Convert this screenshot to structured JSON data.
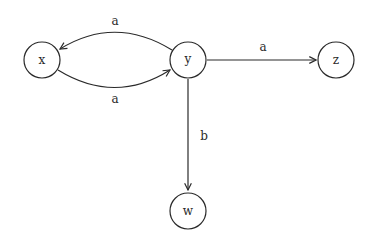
{
  "diagram": {
    "type": "state-graph",
    "nodes": [
      {
        "id": "x",
        "label": "x"
      },
      {
        "id": "y",
        "label": "y"
      },
      {
        "id": "z",
        "label": "z"
      },
      {
        "id": "w",
        "label": "w"
      }
    ],
    "edges": [
      {
        "from": "y",
        "to": "x",
        "label": "a"
      },
      {
        "from": "x",
        "to": "y",
        "label": "a"
      },
      {
        "from": "y",
        "to": "z",
        "label": "a"
      },
      {
        "from": "y",
        "to": "w",
        "label": "b"
      }
    ]
  }
}
